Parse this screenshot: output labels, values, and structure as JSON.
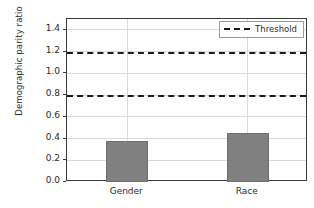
{
  "chart_data": {
    "type": "bar",
    "title": "",
    "xlabel": "",
    "ylabel": "Demographic parity ratio",
    "categories": [
      "Gender",
      "Race"
    ],
    "values": [
      0.38,
      0.455
    ],
    "series": [
      {
        "name": "Demographic parity ratio",
        "values": [
          0.38,
          0.455
        ],
        "color": "#808080"
      }
    ],
    "ylim": [
      0.0,
      1.5
    ],
    "yticks": [
      0.0,
      0.2,
      0.4,
      0.6,
      0.8,
      1.0,
      1.2,
      1.4
    ],
    "ytick_labels": [
      "0.0",
      "0.2",
      "0.4",
      "0.6",
      "0.8",
      "1.0",
      "1.2",
      "1.4"
    ],
    "grid": true,
    "annotations": [
      {
        "name": "upper-threshold",
        "type": "hline",
        "value": 1.2,
        "style": "dashed",
        "color": "#1a1a1a"
      },
      {
        "name": "lower-threshold",
        "type": "hline",
        "value": 0.8,
        "style": "dashed",
        "color": "#1a1a1a"
      }
    ],
    "legend": {
      "position": "upper right",
      "entries": [
        {
          "label": "Threshold",
          "marker": "dashed-line",
          "color": "#1a1a1a"
        }
      ]
    }
  }
}
